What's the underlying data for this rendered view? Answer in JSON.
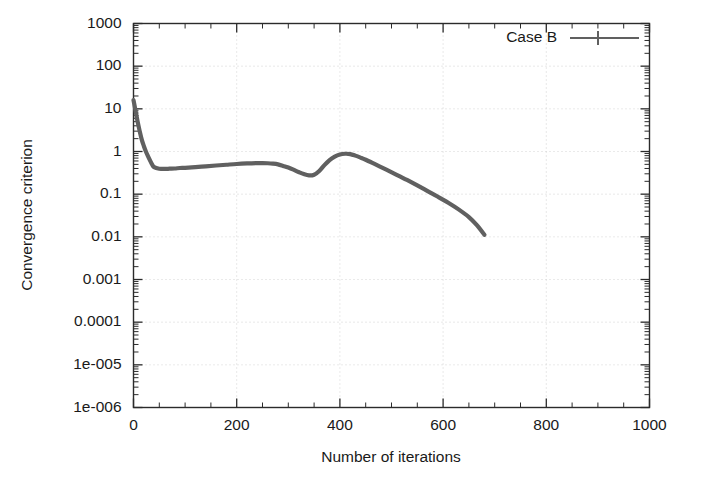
{
  "chart_data": {
    "type": "line",
    "title": "",
    "xlabel": "Number of iterations",
    "ylabel": "Convergence criterion",
    "xlim": [
      0,
      1000
    ],
    "ylim": [
      1e-06,
      1000
    ],
    "yscale": "log",
    "xscale": "linear",
    "grid": true,
    "legend_position": "top-right",
    "xticks": [
      0,
      200,
      400,
      600,
      800,
      1000
    ],
    "xtick_labels": [
      "0",
      "200",
      "400",
      "600",
      "800",
      "1000"
    ],
    "yticks": [
      1000,
      100,
      10,
      1,
      0.1,
      0.01,
      0.001,
      0.0001,
      1e-05,
      1e-06
    ],
    "ytick_labels": [
      "1000",
      "100",
      "10",
      "1",
      "0.1",
      "0.01",
      "0.001",
      "0.0001",
      "1e-005",
      "1e-006"
    ],
    "series": [
      {
        "name": "Case B",
        "color": "#606060",
        "marker": "plus",
        "linestyle": "solid",
        "x": [
          0,
          4,
          8,
          12,
          16,
          20,
          24,
          28,
          32,
          36,
          40,
          50,
          60,
          70,
          80,
          90,
          100,
          120,
          140,
          160,
          180,
          200,
          220,
          240,
          250,
          260,
          270,
          280,
          290,
          300,
          310,
          320,
          330,
          340,
          350,
          360,
          370,
          380,
          390,
          400,
          410,
          420,
          430,
          440,
          450,
          470,
          490,
          510,
          530,
          550,
          570,
          590,
          610,
          630,
          650,
          665,
          680
        ],
        "y": [
          16.0,
          9.0,
          5.0,
          3.0,
          1.9,
          1.35,
          1.0,
          0.78,
          0.62,
          0.5,
          0.43,
          0.395,
          0.39,
          0.395,
          0.4,
          0.41,
          0.415,
          0.43,
          0.45,
          0.47,
          0.49,
          0.51,
          0.525,
          0.535,
          0.535,
          0.53,
          0.52,
          0.5,
          0.46,
          0.42,
          0.375,
          0.33,
          0.295,
          0.275,
          0.285,
          0.35,
          0.48,
          0.63,
          0.76,
          0.85,
          0.885,
          0.87,
          0.8,
          0.72,
          0.64,
          0.49,
          0.375,
          0.285,
          0.215,
          0.16,
          0.118,
          0.087,
          0.063,
          0.044,
          0.029,
          0.019,
          0.0112
        ]
      }
    ],
    "annotations": []
  },
  "legend": {
    "entries": [
      {
        "label": "Case B"
      }
    ]
  },
  "axes": {
    "x_title": "Number of iterations",
    "y_title": "Convergence criterion"
  }
}
